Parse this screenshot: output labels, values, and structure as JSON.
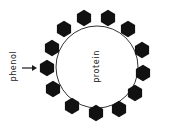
{
  "diagram": {
    "labels": {
      "core": "protein",
      "pointer": "phenol"
    },
    "colors": {
      "background": "#ffffff",
      "hexagon": "#111111",
      "outline": "#333333",
      "text": "#1a1a1a"
    },
    "core_circle": {
      "cx": 97,
      "cy": 67,
      "r": 41
    },
    "hexagons": [
      {
        "x": 84,
        "y": 18
      },
      {
        "x": 108,
        "y": 18
      },
      {
        "x": 64,
        "y": 29
      },
      {
        "x": 128,
        "y": 29
      },
      {
        "x": 52,
        "y": 48
      },
      {
        "x": 142,
        "y": 50
      },
      {
        "x": 47,
        "y": 68
      },
      {
        "x": 143,
        "y": 73
      },
      {
        "x": 53,
        "y": 89
      },
      {
        "x": 135,
        "y": 93
      },
      {
        "x": 72,
        "y": 106
      },
      {
        "x": 119,
        "y": 109
      },
      {
        "x": 96,
        "y": 113
      }
    ],
    "hexagon_count": 13
  }
}
